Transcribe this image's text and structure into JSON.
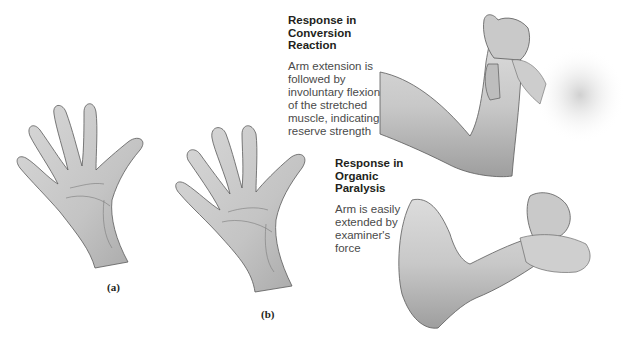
{
  "figure": {
    "panels": [
      {
        "id": "a",
        "label": "(a)",
        "description": "open palm, left hand"
      },
      {
        "id": "b",
        "label": "(b)",
        "description": "open palm, hand"
      }
    ],
    "captions": {
      "conversion": {
        "heading_lines": [
          "Response in",
          "Conversion",
          "Reaction"
        ],
        "body_lines": [
          "Arm extension is",
          "followed by",
          "involuntary flexion",
          "of the stretched",
          "muscle, indicating",
          "reserve strength"
        ]
      },
      "organic": {
        "heading_lines": [
          "Response in",
          "Organic",
          "Paralysis"
        ],
        "body_lines": [
          "Arm is easily",
          "extended by",
          "examiner's",
          "force"
        ]
      }
    },
    "colors": {
      "skin_fill": "#cfcfcf",
      "skin_shadow": "#a9a9a9",
      "outline": "#5a5a5a",
      "text": "#231f20",
      "body_text": "#4a4a4a"
    }
  }
}
